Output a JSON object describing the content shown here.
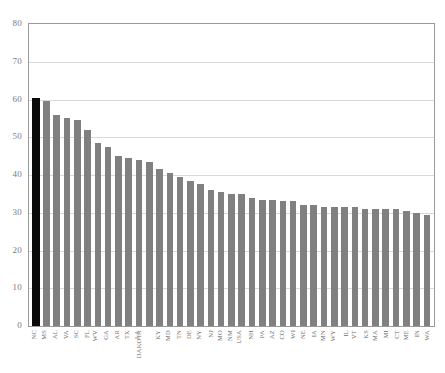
{
  "top_caption": "",
  "chart_data": {
    "type": "bar",
    "title": "",
    "subtitle": "",
    "xlabel": "",
    "ylabel": "",
    "ylim": [
      0,
      80
    ],
    "ytick_step": 10,
    "ytick_labels": [
      "80",
      "70",
      "60",
      "50",
      "40",
      "30",
      "20",
      "10",
      "0"
    ],
    "ytick_values": [
      80,
      70,
      60,
      50,
      40,
      30,
      20,
      10,
      0
    ],
    "grid": true,
    "grid_axis": "y",
    "legend": "none",
    "bar_color": "#808080",
    "highlight_color": "#0a0a0a",
    "highlight_category": "NC",
    "categories": [
      "NC",
      "MS",
      "AL",
      "VA",
      "SC",
      "FL",
      "WV",
      "GA",
      "AR",
      "TX",
      "LA",
      "DAKOTA",
      "KY",
      "MD",
      "TN",
      "DE",
      "NY",
      "NJ",
      "MO",
      "NM",
      "USA",
      "NH",
      "PA",
      "AZ",
      "CO",
      "WI",
      "NE",
      "IA",
      "MN",
      "WY",
      "IL",
      "VT",
      "KS",
      "MA",
      "MI",
      "CT",
      "ME",
      "IN",
      "WA"
    ],
    "values": [
      60.5,
      59.5,
      56.0,
      55.0,
      54.5,
      52.0,
      48.5,
      47.5,
      45.0,
      44.5,
      44.0,
      43.5,
      41.5,
      40.5,
      39.5,
      38.5,
      37.5,
      36.0,
      35.5,
      35.0,
      35.0,
      34.0,
      33.5,
      33.5,
      33.0,
      33.0,
      32.0,
      32.0,
      31.5,
      31.5,
      31.5,
      31.5,
      31.0,
      31.0,
      31.0,
      31.0,
      30.5,
      30.0,
      29.5
    ]
  }
}
